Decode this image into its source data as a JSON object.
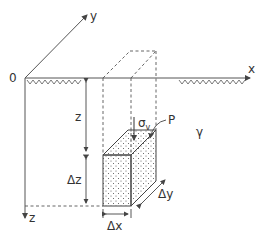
{
  "diagram": {
    "axes": {
      "origin": "0",
      "x": "x",
      "y": "y",
      "z": "z"
    },
    "labels": {
      "depth": "z",
      "delta_z": "Δz",
      "delta_x": "Δx",
      "delta_y": "Δy",
      "stress_symbol": "σ",
      "stress_subscript": "v",
      "point": "P",
      "unit_weight": "γ"
    },
    "colors": {
      "line": "#444444",
      "background": "#ffffff"
    }
  }
}
